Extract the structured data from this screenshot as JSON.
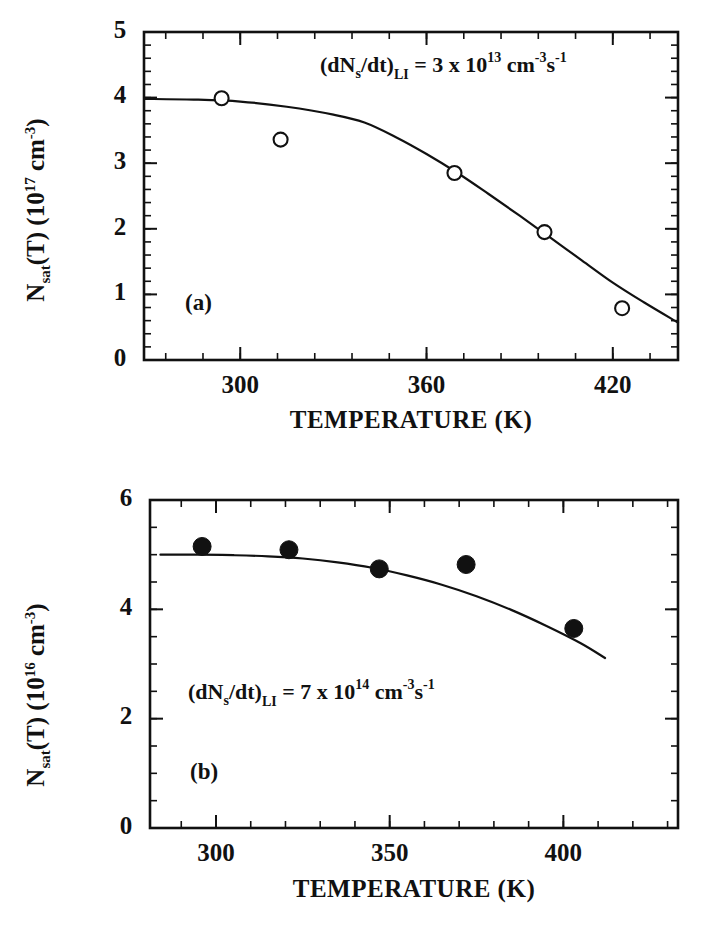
{
  "figure": {
    "background": "#ffffff",
    "ink_color": "#111111",
    "panel_count": 2
  },
  "panels": [
    {
      "tag": "(a)",
      "annotation": {
        "prefix": "(dN",
        "prefix_sub": "s",
        "mid": "/dt)",
        "mid_sub": "LI",
        "equals": " = 3 x 10",
        "exp": "13",
        "unit_cm": " cm",
        "unit_cm_sup": "-3",
        "unit_s": "s",
        "unit_s_sup": "-1",
        "full_text": "(dNs/dt)LI = 3 x 10^13 cm^-3 s^-1"
      },
      "ylabel": {
        "main": "N",
        "main_sub": "sat",
        "mid": "(T)  (10",
        "exp": "17",
        "tail": " cm",
        "tail_sup": "-3",
        "close": ")",
        "full_text": "Nsat(T) (10^17 cm^-3)"
      },
      "xlabel": "TEMPERATURE  (K)"
    },
    {
      "tag": "(b)",
      "annotation": {
        "prefix": "(dN",
        "prefix_sub": "s",
        "mid": "/dt)",
        "mid_sub": "LI",
        "equals": " = 7 x 10",
        "exp": "14",
        "unit_cm": " cm",
        "unit_cm_sup": "-3",
        "unit_s": "s",
        "unit_s_sup": "-1",
        "full_text": "(dNs/dt)LI = 7 x 10^14 cm^-3 s^-1"
      },
      "ylabel": {
        "main": "N",
        "main_sub": "sat",
        "mid": "(T)  (10",
        "exp": "16",
        "tail": " cm",
        "tail_sup": "-3",
        "close": ")",
        "full_text": "Nsat(T) (10^16 cm^-3)"
      },
      "xlabel": "TEMPERATURE  (K)"
    }
  ],
  "chart_data": [
    {
      "type": "scatter",
      "panel": "(a)",
      "title": "",
      "xlabel": "TEMPERATURE  (K)",
      "ylabel": "N_sat(T)  (10^17 cm^-3)",
      "xlim": [
        269,
        441
      ],
      "ylim": [
        0,
        5
      ],
      "xticks": [
        300,
        360,
        420
      ],
      "xtick_labels": [
        "300",
        "360",
        "420"
      ],
      "yticks": [
        0,
        1,
        2,
        3,
        4,
        5
      ],
      "ytick_labels": [
        "0",
        "1",
        "2",
        "3",
        "4",
        "5"
      ],
      "x_minor_step": 12,
      "y_minor_step": 0.2,
      "grid": false,
      "legend": "none",
      "marker": "open-circle",
      "annotation": "(dNs/dt)LI = 3 x 10^13 cm^-3 s^-1",
      "points": [
        {
          "x": 294,
          "y": 3.99
        },
        {
          "x": 313,
          "y": 3.36
        },
        {
          "x": 369,
          "y": 2.85
        },
        {
          "x": 398,
          "y": 1.95
        },
        {
          "x": 423,
          "y": 0.79
        }
      ],
      "fit_curve": [
        {
          "x": 269,
          "y": 3.98
        },
        {
          "x": 285,
          "y": 3.97
        },
        {
          "x": 300,
          "y": 3.94
        },
        {
          "x": 315,
          "y": 3.86
        },
        {
          "x": 330,
          "y": 3.74
        },
        {
          "x": 340,
          "y": 3.62
        },
        {
          "x": 350,
          "y": 3.4
        },
        {
          "x": 360,
          "y": 3.14
        },
        {
          "x": 370,
          "y": 2.85
        },
        {
          "x": 380,
          "y": 2.53
        },
        {
          "x": 390,
          "y": 2.2
        },
        {
          "x": 400,
          "y": 1.86
        },
        {
          "x": 410,
          "y": 1.52
        },
        {
          "x": 420,
          "y": 1.18
        },
        {
          "x": 430,
          "y": 0.88
        },
        {
          "x": 441,
          "y": 0.57
        }
      ]
    },
    {
      "type": "scatter",
      "panel": "(b)",
      "title": "",
      "xlabel": "TEMPERATURE  (K)",
      "ylabel": "N_sat(T)  (10^16 cm^-3)",
      "xlim": [
        281,
        433
      ],
      "ylim": [
        0,
        6
      ],
      "xticks": [
        300,
        350,
        400
      ],
      "xtick_labels": [
        "300",
        "350",
        "400"
      ],
      "yticks": [
        0,
        2,
        4,
        6
      ],
      "ytick_labels": [
        "0",
        "2",
        "4",
        "6"
      ],
      "x_minor_step": 10,
      "y_minor_step": 0.5,
      "grid": false,
      "legend": "none",
      "marker": "filled-circle",
      "annotation": "(dNs/dt)LI = 7 x 10^14 cm^-3 s^-1",
      "points": [
        {
          "x": 296,
          "y": 5.15
        },
        {
          "x": 321,
          "y": 5.09
        },
        {
          "x": 347,
          "y": 4.74
        },
        {
          "x": 372,
          "y": 4.82
        },
        {
          "x": 403,
          "y": 3.65
        }
      ],
      "fit_curve": [
        {
          "x": 284,
          "y": 5.0
        },
        {
          "x": 295,
          "y": 5.0
        },
        {
          "x": 305,
          "y": 4.99
        },
        {
          "x": 315,
          "y": 4.97
        },
        {
          "x": 325,
          "y": 4.93
        },
        {
          "x": 335,
          "y": 4.86
        },
        {
          "x": 345,
          "y": 4.76
        },
        {
          "x": 355,
          "y": 4.62
        },
        {
          "x": 365,
          "y": 4.45
        },
        {
          "x": 375,
          "y": 4.24
        },
        {
          "x": 385,
          "y": 3.99
        },
        {
          "x": 395,
          "y": 3.7
        },
        {
          "x": 405,
          "y": 3.38
        },
        {
          "x": 412,
          "y": 3.11
        }
      ]
    }
  ]
}
